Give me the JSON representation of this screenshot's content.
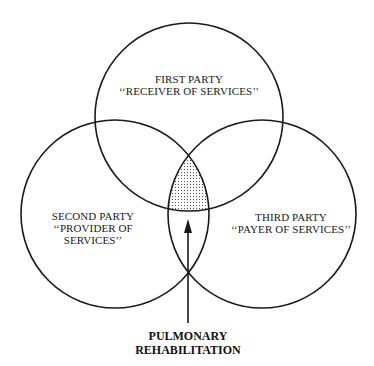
{
  "diagram": {
    "type": "venn",
    "circles": [
      {
        "id": "first",
        "line1": "FIRST PARTY",
        "line2": "‘‘RECEIVER OF SERVICES’’",
        "line3": ""
      },
      {
        "id": "second",
        "line1": "SECOND PARTY",
        "line2": "‘‘PROVIDER OF",
        "line3": "SERVICES’’"
      },
      {
        "id": "third",
        "line1": "THIRD PARTY",
        "line2": "‘‘PAYER OF SERVICES’’",
        "line3": ""
      }
    ],
    "intersection_label": {
      "line1": "PULMONARY",
      "line2": "REHABILITATION"
    },
    "colors": {
      "stroke": "#1a1a1a",
      "stipple": "#333333",
      "background": "#ffffff"
    }
  }
}
